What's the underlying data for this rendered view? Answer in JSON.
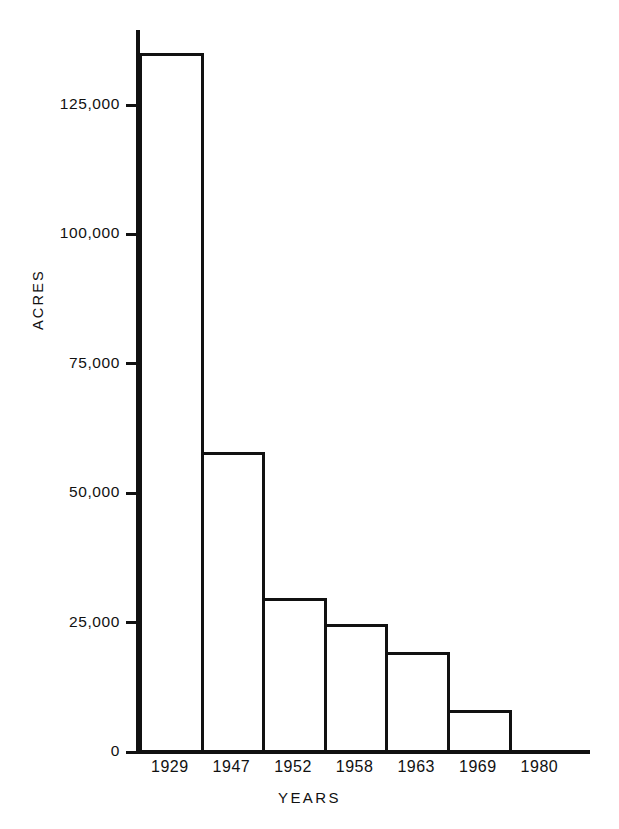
{
  "chart_data": {
    "type": "bar",
    "title": "",
    "subtitle": "",
    "xlabel": "YEARS",
    "ylabel": "ACRES",
    "categories": [
      "1929",
      "1947",
      "1952",
      "1958",
      "1963",
      "1969",
      "1980"
    ],
    "values": [
      135000,
      58000,
      29800,
      24700,
      19300,
      8100,
      0
    ],
    "ylim": [
      0,
      137000
    ],
    "y_ticks": [
      0,
      25000,
      50000,
      75000,
      100000,
      125000
    ],
    "y_tick_labels": [
      "0",
      "25,000",
      "50,000",
      "75,000",
      "100,000",
      "125,000"
    ],
    "x_tick_labels": [
      "1929",
      "1947",
      "1952",
      "1958",
      "1963",
      "1969",
      "1980"
    ],
    "grid": false,
    "legend": null,
    "legend_position": "none",
    "bar_style": "outline",
    "bar_fill_color": "#ffffff",
    "bar_edge_color": "#111111",
    "axis_color": "#111111",
    "background_color": "#ffffff",
    "annotations": []
  },
  "axis": {
    "y_title": "ACRES",
    "x_title": "YEARS"
  }
}
